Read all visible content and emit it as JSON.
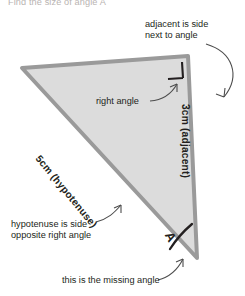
{
  "page": {
    "width": 245,
    "height": 296,
    "background": "#ffffff"
  },
  "question": {
    "text": "Find the size of angle A",
    "color": "#b9b4b2"
  },
  "figure": {
    "type": "right-triangle",
    "fill_color": "#dcdcdc",
    "stroke_color": "#9a9a9a",
    "stroke_width": 4,
    "vertices": {
      "top_left": [
        22,
        68
      ],
      "top_right": [
        188,
        56
      ],
      "bottom_right": [
        197,
        258
      ]
    },
    "right_angle_marker": {
      "at_vertex": "top_right",
      "color": "#231f20"
    },
    "angle_arc": {
      "at_vertex": "bottom_right",
      "color": "#231f20"
    }
  },
  "side_labels": {
    "adjacent": "3cm (adjacent)",
    "hypotenuse": "5cm (hypotenuse)",
    "angle": "A"
  },
  "annotations": {
    "adjacent_note": "adjacent is side\nnext to angle",
    "right_angle_note": "right angle",
    "hypotenuse_note": "hypotenuse is side\nopposite right angle",
    "missing_angle_note": "this is the missing angle"
  },
  "colors": {
    "text": "#231f20",
    "leader_line": "#4d4d4d",
    "faded_text": "#b9b4b2"
  }
}
